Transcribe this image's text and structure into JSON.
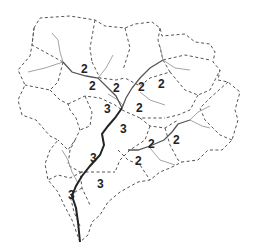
{
  "diagram": {
    "type": "watershed stream-order diagram",
    "colors": {
      "boundary": "#555555",
      "first_order_stream": "#9a9a9a",
      "second_order_stream": "#555555",
      "third_order_stream": "#222222",
      "label": "#222222"
    },
    "labels": [
      {
        "id": "l1",
        "text": "2",
        "x": 81,
        "y": 73
      },
      {
        "id": "l2",
        "text": "2",
        "x": 89,
        "y": 90
      },
      {
        "id": "l3",
        "text": "2",
        "x": 113,
        "y": 92
      },
      {
        "id": "l4",
        "text": "2",
        "x": 138,
        "y": 91
      },
      {
        "id": "l5",
        "text": "2",
        "x": 158,
        "y": 88
      },
      {
        "id": "l6",
        "text": "2",
        "x": 136,
        "y": 112
      },
      {
        "id": "l7",
        "text": "3",
        "x": 104,
        "y": 113
      },
      {
        "id": "l8",
        "text": "3",
        "x": 120,
        "y": 133
      },
      {
        "id": "l9",
        "text": "2",
        "x": 148,
        "y": 148
      },
      {
        "id": "l10",
        "text": "2",
        "x": 173,
        "y": 144
      },
      {
        "id": "l11",
        "text": "3",
        "x": 90,
        "y": 162
      },
      {
        "id": "l12",
        "text": "2",
        "x": 135,
        "y": 165
      },
      {
        "id": "l13",
        "text": "3",
        "x": 97,
        "y": 188
      },
      {
        "id": "l14",
        "text": "3",
        "x": 68,
        "y": 199
      }
    ]
  }
}
